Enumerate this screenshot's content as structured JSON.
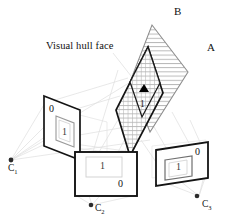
{
  "figure": {
    "title_annotation": "Visual hull face",
    "vertex_labels": {
      "apex_b": "B",
      "right_a": "A"
    },
    "cameras": [
      {
        "name": "camera-1",
        "label_base": "C",
        "label_sub": "1"
      },
      {
        "name": "camera-2",
        "label_base": "C",
        "label_sub": "2"
      },
      {
        "name": "camera-3",
        "label_base": "C",
        "label_sub": "3"
      }
    ],
    "image_planes": [
      {
        "name": "image-plane-c1",
        "background_value": "0",
        "silhouette_value": "1"
      },
      {
        "name": "image-plane-c2",
        "background_value": "0",
        "silhouette_value": "1"
      },
      {
        "name": "image-plane-c3",
        "background_value": "0",
        "silhouette_value": "1"
      }
    ],
    "volume_labels": {
      "inside_value": "1"
    },
    "colors": {
      "ink": "#111111",
      "gray_outline": "#8a8a8a",
      "faint_ray": "#d8d8d8",
      "hatch": "#9a9a9a",
      "grid": "#b0b0b0",
      "background": "#ffffff",
      "marker": "#000000"
    }
  }
}
